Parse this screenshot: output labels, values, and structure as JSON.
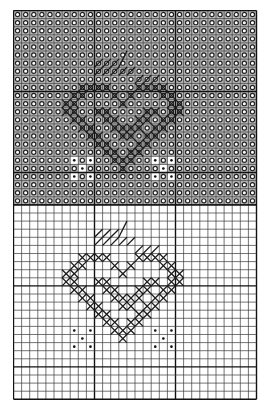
{
  "diagram": {
    "type": "cross-stitch-chart",
    "columns": 30,
    "cell_size": 8.1,
    "major_grid_every": 10,
    "colors": {
      "grid_minor": "#3a3a3a",
      "grid_major": "#111111",
      "shaded_fill": "#b8b8b8",
      "symbol_o": "#222222",
      "cross": "#1a1a1a",
      "backstitch": "#1a1a1a",
      "dot": "#111111"
    },
    "sections": [
      {
        "name": "shaded-chart",
        "rows": 24,
        "background_symbol": "o",
        "shaded": true,
        "heart_offset": [
          5,
          4
        ],
        "unshaded_cells_note": "diamond interior and dot cells shown without o-symbol"
      },
      {
        "name": "plain-chart",
        "rows": 24,
        "background_symbol": "",
        "shaded": false,
        "heart_offset": [
          5,
          1
        ]
      }
    ],
    "heart": {
      "cross_cells": [
        [
          3,
          5
        ],
        [
          4,
          5
        ],
        [
          5,
          5
        ],
        [
          6,
          5
        ],
        [
          10,
          5
        ],
        [
          11,
          5
        ],
        [
          12,
          5
        ],
        [
          13,
          5
        ],
        [
          2,
          6
        ],
        [
          3,
          6
        ],
        [
          7,
          6
        ],
        [
          9,
          6
        ],
        [
          13,
          6
        ],
        [
          14,
          6
        ],
        [
          1,
          7
        ],
        [
          2,
          7
        ],
        [
          8,
          7
        ],
        [
          14,
          7
        ],
        [
          15,
          7
        ],
        [
          1,
          8
        ],
        [
          2,
          8
        ],
        [
          5,
          8
        ],
        [
          6,
          8
        ],
        [
          11,
          8
        ],
        [
          12,
          8
        ],
        [
          14,
          8
        ],
        [
          15,
          8
        ],
        [
          2,
          9
        ],
        [
          3,
          9
        ],
        [
          6,
          9
        ],
        [
          7,
          9
        ],
        [
          10,
          9
        ],
        [
          11,
          9
        ],
        [
          13,
          9
        ],
        [
          14,
          9
        ],
        [
          3,
          10
        ],
        [
          4,
          10
        ],
        [
          7,
          10
        ],
        [
          8,
          10
        ],
        [
          9,
          10
        ],
        [
          10,
          10
        ],
        [
          12,
          10
        ],
        [
          13,
          10
        ],
        [
          4,
          11
        ],
        [
          5,
          11
        ],
        [
          8,
          11
        ],
        [
          9,
          11
        ],
        [
          11,
          11
        ],
        [
          12,
          11
        ],
        [
          5,
          12
        ],
        [
          6,
          12
        ],
        [
          10,
          12
        ],
        [
          11,
          12
        ],
        [
          6,
          13
        ],
        [
          7,
          13
        ],
        [
          9,
          13
        ],
        [
          10,
          13
        ],
        [
          7,
          14
        ],
        [
          8,
          14
        ],
        [
          9,
          14
        ],
        [
          8,
          15
        ]
      ],
      "backstitch_lines": [
        [
          [
            5,
            3
          ],
          [
            6,
            2
          ]
        ],
        [
          [
            6,
            3
          ],
          [
            7,
            2
          ]
        ],
        [
          [
            7,
            3
          ],
          [
            8,
            2
          ]
        ],
        [
          [
            8,
            3
          ],
          [
            9,
            1
          ]
        ],
        [
          [
            5,
            4
          ],
          [
            6,
            3
          ]
        ],
        [
          [
            6,
            4
          ],
          [
            7,
            3
          ]
        ],
        [
          [
            7,
            4
          ],
          [
            8,
            3
          ]
        ],
        [
          [
            8,
            4
          ],
          [
            9,
            3
          ]
        ],
        [
          [
            9,
            4
          ],
          [
            10,
            3
          ]
        ],
        [
          [
            10,
            5
          ],
          [
            11,
            4
          ]
        ],
        [
          [
            11,
            5
          ],
          [
            12,
            4
          ]
        ],
        [
          [
            12,
            5
          ],
          [
            13,
            4
          ]
        ]
      ],
      "dot_cells": [
        [
          2,
          14
        ],
        [
          4,
          14
        ],
        [
          3,
          15
        ],
        [
          2,
          16
        ],
        [
          4,
          16
        ],
        [
          12,
          14
        ],
        [
          14,
          14
        ],
        [
          13,
          15
        ],
        [
          12,
          16
        ],
        [
          14,
          16
        ]
      ]
    }
  }
}
